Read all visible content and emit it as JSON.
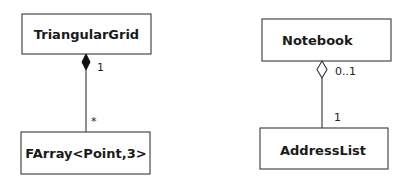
{
  "diagrams": [
    {
      "kind": "composition",
      "whole": {
        "name": "TriangularGrid",
        "multiplicity": "1"
      },
      "part": {
        "name": "FArray<Point,3>",
        "multiplicity": "*"
      }
    },
    {
      "kind": "aggregation",
      "whole": {
        "name": "Notebook",
        "multiplicity": "0..1"
      },
      "part": {
        "name": "AddressList",
        "multiplicity": "1"
      }
    }
  ]
}
